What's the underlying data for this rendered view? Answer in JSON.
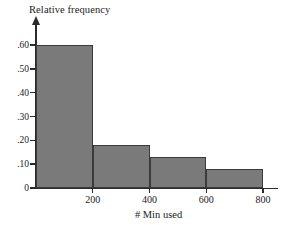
{
  "chart_data": {
    "type": "bar",
    "title": "",
    "subtitle": "",
    "xlabel": "# Min used",
    "ylabel": "Relative frequency",
    "categories": [
      "0-200",
      "200-400",
      "400-600",
      "600-800"
    ],
    "bin_edges": [
      0,
      200,
      400,
      600,
      800
    ],
    "values": [
      0.6,
      0.18,
      0.13,
      0.08
    ],
    "xlim": [
      0,
      800
    ],
    "ylim": [
      0,
      0.6
    ],
    "xticks": [
      200,
      400,
      600,
      800
    ],
    "xtick_labels": [
      "200",
      "400",
      "600",
      "800"
    ],
    "yticks": [
      0,
      0.1,
      0.2,
      0.3,
      0.4,
      0.5,
      0.6
    ],
    "ytick_labels": [
      "0",
      ".10",
      ".20",
      ".30",
      ".40",
      ".50",
      ".60"
    ],
    "grid": false,
    "legend": false,
    "legend_position": "none",
    "bar_fill_color": "#7a7a7a",
    "bar_edge_color": "#3a3a3a",
    "axis_color": "#2b2b2b",
    "background_color": "#ffffff",
    "annotations": []
  },
  "axes": {
    "y_title": "Relative frequency",
    "x_title": "# Min used"
  }
}
